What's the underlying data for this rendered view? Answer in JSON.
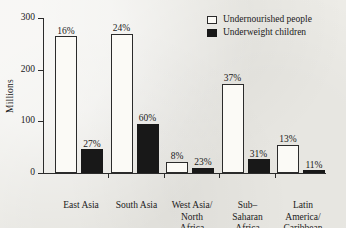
{
  "chart_data": {
    "type": "bar",
    "title": "",
    "xlabel": "",
    "ylabel": "Millions",
    "ylim": [
      0,
      300
    ],
    "yticks": [
      0,
      100,
      200,
      300
    ],
    "grid": false,
    "legend_position": "top-right",
    "categories": [
      "East Asia",
      "South Asia",
      "West Asia/\nNorth\nAfrica",
      "Sub–\nSaharan\nAfrica",
      "Latin\nAmerica/\nCaribbean"
    ],
    "series": [
      {
        "name": "Undernourished people",
        "color": "#fbfaf6",
        "values": [
          265,
          270,
          22,
          173,
          55
        ],
        "point_labels": [
          "16%",
          "24%",
          "8%",
          "37%",
          "13%"
        ]
      },
      {
        "name": "Underweight children",
        "color": "#181818",
        "values": [
          46,
          95,
          10,
          27,
          5
        ],
        "point_labels": [
          "27%",
          "60%",
          "23%",
          "31%",
          "11%"
        ]
      }
    ]
  },
  "legend": {
    "items": [
      {
        "label": "Undernourished people",
        "swatch": "light-square-swatch"
      },
      {
        "label": "Underweight children",
        "swatch": "dark-square-swatch"
      }
    ]
  }
}
